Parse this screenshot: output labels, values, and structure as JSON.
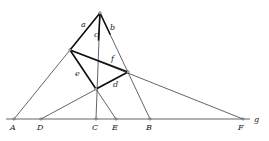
{
  "figure": {
    "type": "geometric-construction",
    "baseline_label": "g",
    "points": {
      "A": {
        "label": "A",
        "x": 14,
        "y": 119
      },
      "D": {
        "label": "D",
        "x": 41,
        "y": 119
      },
      "C": {
        "label": "C",
        "x": 96,
        "y": 119
      },
      "E": {
        "label": "E",
        "x": 116,
        "y": 119
      },
      "B": {
        "label": "B",
        "x": 150,
        "y": 119
      },
      "F": {
        "label": "F",
        "x": 243,
        "y": 119
      },
      "apex": {
        "x": 100,
        "y": 13
      },
      "left": {
        "x": 70,
        "y": 50
      },
      "right": {
        "x": 128,
        "y": 72
      },
      "bottom": {
        "x": 96,
        "y": 89
      }
    },
    "line_labels": {
      "a": "a",
      "b": "b",
      "c": "c",
      "d": "d",
      "e": "e",
      "f": "f"
    }
  }
}
